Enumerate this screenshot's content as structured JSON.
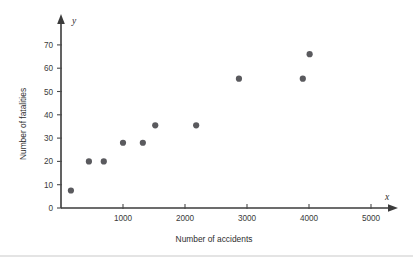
{
  "chart_data": {
    "type": "scatter",
    "title": "",
    "xlabel": "Number of accidents",
    "ylabel": "Number of fatalities",
    "x_var_symbol": "x",
    "y_var_symbol": "y",
    "xlim": [
      0,
      5300
    ],
    "ylim": [
      0,
      75
    ],
    "grid": false,
    "legend": null,
    "x_ticks": [
      0,
      1000,
      2000,
      3000,
      4000,
      5000
    ],
    "x_tick_labels": [
      "",
      "1000",
      "2000",
      "3000",
      "4000",
      "5000"
    ],
    "y_ticks": [
      0,
      10,
      20,
      30,
      40,
      50,
      60,
      70
    ],
    "y_tick_labels": [
      "0",
      "10",
      "20",
      "30",
      "40",
      "50",
      "60",
      "70"
    ],
    "points": [
      {
        "x": 160,
        "y": 7.5
      },
      {
        "x": 450,
        "y": 20
      },
      {
        "x": 690,
        "y": 20
      },
      {
        "x": 1000,
        "y": 28
      },
      {
        "x": 1320,
        "y": 28
      },
      {
        "x": 1520,
        "y": 35.5
      },
      {
        "x": 2180,
        "y": 35.5
      },
      {
        "x": 2870,
        "y": 55.5
      },
      {
        "x": 3900,
        "y": 55.5
      },
      {
        "x": 4010,
        "y": 66
      }
    ],
    "marker_color": "#5a5a5e",
    "axis_color": "#3b3b3b"
  }
}
